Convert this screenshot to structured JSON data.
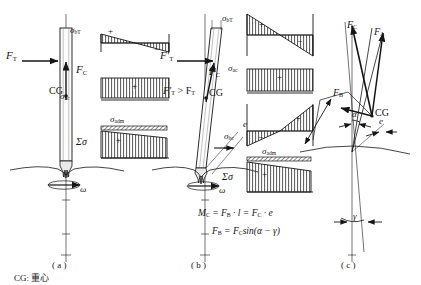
{
  "figure": {
    "legend_text": "CG: 重心",
    "panels": [
      {
        "id": "a",
        "caption": "( a )"
      },
      {
        "id": "b",
        "caption": "( b )"
      },
      {
        "id": "c",
        "caption": "( c )"
      }
    ]
  },
  "panel_a": {
    "force_tension": "F",
    "force_tension_sub": "T",
    "force_comp": "F",
    "force_comp_sub": "C",
    "cg": "CG",
    "omega": "ω",
    "stress_bending_tension": "σ",
    "stress_bending_tension_sub": "bT",
    "stress_axial_comp": "σ",
    "stress_axial_comp_sub": "ac",
    "stress_admissible": "σ",
    "stress_admissible_sub": "adm",
    "stress_sum": "Σσ",
    "plus": "+",
    "minus": "−"
  },
  "panel_b": {
    "force_tension": "F′",
    "force_tension_sub": "T",
    "force_comp": "F",
    "force_comp_sub": "C",
    "cg": "CG",
    "omega": "ω",
    "eccentricity": "e",
    "inequality": "F′",
    "inequality_sub1": "T",
    "inequality_mid": " > F",
    "inequality_sub2": "T",
    "stress_bending_tension": "σ",
    "stress_bending_tension_sub": "bT",
    "stress_axial_comp": "σ",
    "stress_axial_comp_sub": "ac",
    "stress_bending_comp": "σ",
    "stress_bending_comp_sub": "bc",
    "stress_admissible": "σ",
    "stress_admissible_sub": "adm",
    "stress_sum": "Σσ",
    "plus": "+",
    "minus": "−",
    "equation_1": "M",
    "equation_1_sub": "C",
    "equation_1_rest": " = F",
    "equation_1_sub2": "B",
    "equation_1_rest2": " · l = F",
    "equation_1_sub3": "C",
    "equation_1_rest3": " · e",
    "equation_2": "F",
    "equation_2_sub": "B",
    "equation_2_rest": " = F",
    "equation_2_sub2": "C",
    "equation_2_rest2": "sin(α − γ)"
  },
  "panel_c": {
    "force_comp": "F",
    "force_comp_sub": "C",
    "force_axial": "F",
    "force_axial_sub": "A",
    "force_bend": "F",
    "force_bend_sub": "B",
    "cg": "CG",
    "angle_alpha": "α",
    "angle_gamma": "γ",
    "eccentricity": "e"
  },
  "colors": {
    "ink": "#151515",
    "hatch": "#2a2a2a",
    "paper": "#ffffff"
  }
}
